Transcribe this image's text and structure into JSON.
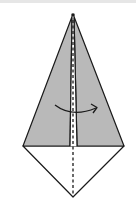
{
  "diagram": {
    "type": "origami-fold-step",
    "colors": {
      "paper_colored": "#b9b9b9",
      "paper_white": "#ffffff",
      "line": "#1a1a1a",
      "top_strip": "#e6e6e6"
    },
    "elements": {
      "kite_shape": "kite with colored upper flaps",
      "center_fold_line": "valley-fold-dashed",
      "fold_arrow": "curved-arrow-right"
    }
  }
}
